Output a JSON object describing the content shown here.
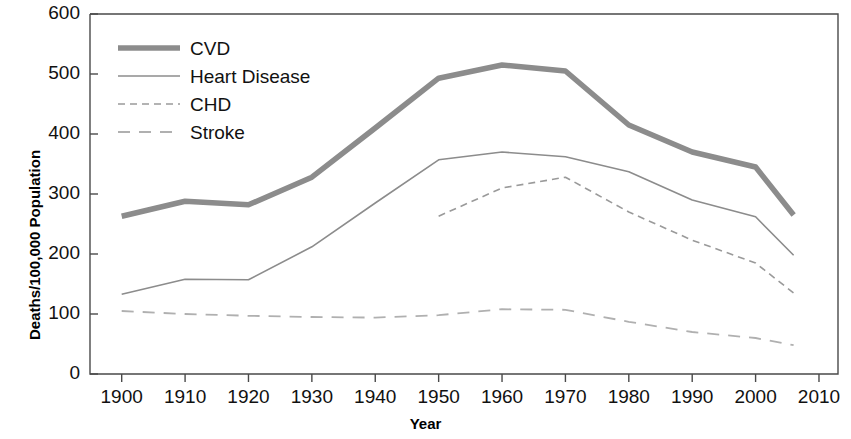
{
  "chart_data": {
    "type": "line",
    "title": "",
    "xlabel": "Year",
    "ylabel": "Deaths/100,000 Population",
    "xlim": [
      1895,
      2013
    ],
    "ylim": [
      0,
      600
    ],
    "ytick_step": 100,
    "grid": false,
    "legend_position": "top-left",
    "xticks": [
      "1900",
      "1910",
      "1920",
      "1930",
      "1940",
      "1950",
      "1960",
      "1970",
      "1980",
      "1990",
      "2000",
      "2010"
    ],
    "yticks": [
      "0",
      "100",
      "200",
      "300",
      "400",
      "500",
      "600"
    ],
    "series": [
      {
        "name": "CVD",
        "style": "solid-thick",
        "color": "#8c8c8c",
        "x": [
          1900,
          1910,
          1920,
          1930,
          1940,
          1950,
          1960,
          1970,
          1980,
          1990,
          2000,
          2006
        ],
        "values": [
          263,
          288,
          282,
          328,
          410,
          493,
          515,
          505,
          415,
          370,
          345,
          265
        ]
      },
      {
        "name": "Heart Disease",
        "style": "solid-thin",
        "color": "#8c8c8c",
        "x": [
          1900,
          1910,
          1920,
          1930,
          1940,
          1950,
          1960,
          1970,
          1980,
          1990,
          2000,
          2006
        ],
        "values": [
          133,
          158,
          157,
          212,
          285,
          357,
          370,
          362,
          337,
          290,
          262,
          198
        ]
      },
      {
        "name": "CHD",
        "style": "dashed-short",
        "color": "#9a9a9a",
        "x": [
          1950,
          1960,
          1970,
          1980,
          1990,
          2000,
          2006
        ],
        "values": [
          263,
          310,
          328,
          270,
          223,
          185,
          135
        ]
      },
      {
        "name": "Stroke",
        "style": "dashed-long",
        "color": "#b0b0b0",
        "x": [
          1900,
          1910,
          1920,
          1930,
          1940,
          1950,
          1960,
          1970,
          1980,
          1990,
          2000,
          2006
        ],
        "values": [
          105,
          100,
          97,
          95,
          94,
          98,
          108,
          107,
          87,
          70,
          60,
          48
        ]
      }
    ]
  },
  "legend": {
    "items": [
      {
        "label": "CVD"
      },
      {
        "label": "Heart Disease"
      },
      {
        "label": "CHD"
      },
      {
        "label": "Stroke"
      }
    ]
  },
  "axis": {
    "y_title": "Deaths/100,000 Population",
    "x_title": "Year"
  }
}
